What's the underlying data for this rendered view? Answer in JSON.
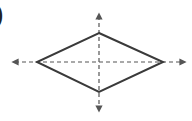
{
  "figure": {
    "label_fragment": ")",
    "shape": "rhombus",
    "stroke_color": "#3a3a3a",
    "axis_color": "#555555",
    "vertices": {
      "top": [
        99,
        33
      ],
      "right": [
        163,
        62
      ],
      "bottom": [
        99,
        92
      ],
      "left": [
        37,
        62
      ]
    },
    "axes": {
      "horizontal": {
        "from": [
          12,
          62
        ],
        "to": [
          186,
          62
        ],
        "style": "dashed",
        "arrows": "both"
      },
      "vertical": {
        "from": [
          99,
          13
        ],
        "to": [
          99,
          112
        ],
        "style": "dashed",
        "arrows": "both"
      }
    }
  }
}
